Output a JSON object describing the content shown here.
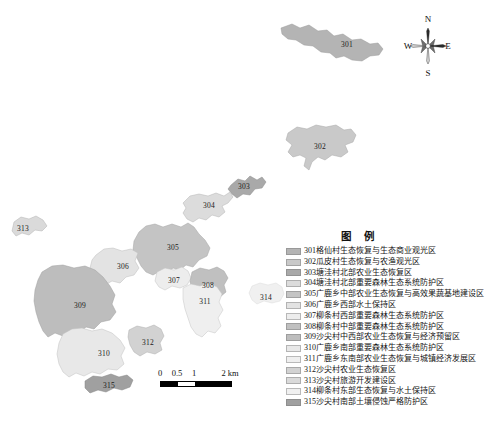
{
  "map": {
    "title": "",
    "region_labels": [
      {
        "id": "301",
        "x": 347,
        "y": 44
      },
      {
        "id": "302",
        "x": 320,
        "y": 146
      },
      {
        "id": "303",
        "x": 244,
        "y": 186
      },
      {
        "id": "304",
        "x": 209,
        "y": 205
      },
      {
        "id": "305",
        "x": 173,
        "y": 247
      },
      {
        "id": "306",
        "x": 123,
        "y": 266
      },
      {
        "id": "307",
        "x": 174,
        "y": 280
      },
      {
        "id": "308",
        "x": 208,
        "y": 285
      },
      {
        "id": "309",
        "x": 80,
        "y": 305
      },
      {
        "id": "310",
        "x": 104,
        "y": 353
      },
      {
        "id": "311",
        "x": 205,
        "y": 301
      },
      {
        "id": "312",
        "x": 148,
        "y": 342
      },
      {
        "id": "313",
        "x": 23,
        "y": 228
      },
      {
        "id": "314",
        "x": 266,
        "y": 297
      },
      {
        "id": "315",
        "x": 109,
        "y": 385
      }
    ]
  },
  "compass": {
    "north": "N",
    "south": "S",
    "west": "W",
    "east": "E"
  },
  "scalebar": {
    "ticks": [
      "0",
      "0.5",
      "1",
      "2 km"
    ],
    "unit": "km"
  },
  "legend": {
    "title": "图 例",
    "items": [
      {
        "code": "301",
        "label": "301格仙村生态恢复与生态商业观光区",
        "color": "#b4b4b4"
      },
      {
        "code": "302",
        "label": "302瓜皮村生态恢复与农渔观光区",
        "color": "#c9c9c9"
      },
      {
        "code": "303",
        "label": "303塘洼村北部农业生态恢复区",
        "color": "#a9a9a9"
      },
      {
        "code": "304",
        "label": "304塘洼村北部重要森林生态系统防护区",
        "color": "#dcdcdc"
      },
      {
        "code": "305",
        "label": "305广鹿乡中部农业生态恢复与高效果蔬基地建设区",
        "color": "#c4c4c4"
      },
      {
        "code": "306",
        "label": "306广鹿乡西部水土保持区",
        "color": "#e3e3e3"
      },
      {
        "code": "307",
        "label": "307柳条村西部重要森林生态系统防护区",
        "color": "#ededed"
      },
      {
        "code": "308",
        "label": "308柳条村中部重要森林生态系统防护区",
        "color": "#c0c0c0"
      },
      {
        "code": "309",
        "label": "309沙尖村中西部农业生态恢复与经济预留区",
        "color": "#bdbdbd"
      },
      {
        "code": "310",
        "label": "310广鹿乡南部重要森林生态系统防护区",
        "color": "#e8e8e8"
      },
      {
        "code": "311",
        "label": "311广鹿乡东南部农业生态恢复与城镇经济发展区",
        "color": "#efefef"
      },
      {
        "code": "312",
        "label": "312沙尖村农业生态恢复区",
        "color": "#d2d2d2"
      },
      {
        "code": "313",
        "label": "313沙尖村旅游开发建设区",
        "color": "#dadada"
      },
      {
        "code": "314",
        "label": "314柳条村东部生态恢复与水土保持区",
        "color": "#f0f0f0"
      },
      {
        "code": "315",
        "label": "315沙尖村南部土壤侵蚀严格防护区",
        "color": "#a0a0a0"
      }
    ]
  },
  "caption": {
    "text": ""
  }
}
